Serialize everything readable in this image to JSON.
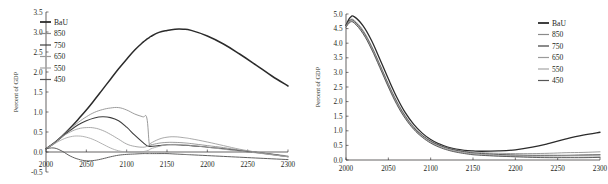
{
  "figure": {
    "background": "#ffffff",
    "panels": [
      "left",
      "right"
    ]
  },
  "chart_data": [
    {
      "panel": "left",
      "type": "line",
      "title": "",
      "xlabel": "",
      "ylabel": "Percent of GDP",
      "xlim": [
        2000,
        2300
      ],
      "ylim": [
        -0.5,
        3.5
      ],
      "xticks": [
        2000,
        2050,
        2100,
        2150,
        2200,
        2250,
        2300
      ],
      "xticklabels": [
        "2000",
        "2050",
        "2100",
        "2150",
        "2200",
        "2250",
        "2300"
      ],
      "yticks": [
        -0.5,
        0.0,
        0.5,
        1.0,
        1.5,
        2.0,
        2.5,
        3.0,
        3.5
      ],
      "yticklabels": [
        "-0.5",
        "0.0",
        "0.5",
        "1.0",
        "1.5",
        "2.0",
        "2.5",
        "3.0",
        "3.5"
      ],
      "grid": false,
      "legend_position": "upper-left",
      "x": [
        2000,
        2010,
        2020,
        2030,
        2040,
        2050,
        2060,
        2070,
        2080,
        2090,
        2100,
        2110,
        2120,
        2125,
        2128,
        2130,
        2140,
        2150,
        2160,
        2170,
        2180,
        2200,
        2220,
        2240,
        2260,
        2280,
        2300
      ],
      "series": [
        {
          "name": "BaU",
          "color": "#2b2b2b",
          "width": 1.5,
          "values": [
            0.08,
            0.22,
            0.4,
            0.6,
            0.82,
            1.05,
            1.3,
            1.56,
            1.82,
            2.08,
            2.32,
            2.55,
            2.74,
            2.82,
            2.86,
            2.89,
            2.99,
            3.04,
            3.07,
            3.07,
            3.04,
            2.9,
            2.7,
            2.45,
            2.18,
            1.9,
            1.65
          ]
        },
        {
          "name": "850",
          "color": "#8a8a8a",
          "width": 0.85,
          "values": [
            0.08,
            0.22,
            0.4,
            0.58,
            0.74,
            0.88,
            0.99,
            1.06,
            1.1,
            1.11,
            1.05,
            0.95,
            0.88,
            0.85,
            0.2,
            0.18,
            0.22,
            0.24,
            0.24,
            0.23,
            0.21,
            0.16,
            0.11,
            0.05,
            0.0,
            -0.05,
            -0.1
          ]
        },
        {
          "name": "750",
          "color": "#3d3d3d",
          "width": 1.1,
          "values": [
            0.08,
            0.22,
            0.38,
            0.54,
            0.68,
            0.78,
            0.85,
            0.88,
            0.86,
            0.78,
            0.62,
            0.42,
            0.24,
            0.16,
            0.14,
            0.14,
            0.16,
            0.18,
            0.18,
            0.17,
            0.16,
            0.12,
            0.08,
            0.03,
            -0.01,
            -0.06,
            -0.12
          ]
        },
        {
          "name": "650",
          "color": "#9a9a9a",
          "width": 0.85,
          "values": [
            0.08,
            0.22,
            0.38,
            0.5,
            0.58,
            0.61,
            0.6,
            0.54,
            0.44,
            0.32,
            0.2,
            0.14,
            0.12,
            0.14,
            0.18,
            0.22,
            0.32,
            0.37,
            0.38,
            0.36,
            0.33,
            0.25,
            0.16,
            0.07,
            0.0,
            -0.06,
            -0.12
          ]
        },
        {
          "name": "550",
          "color": "#a5a5a5",
          "width": 0.85,
          "values": [
            0.08,
            0.2,
            0.31,
            0.38,
            0.4,
            0.37,
            0.3,
            0.2,
            0.1,
            0.03,
            0.0,
            0.0,
            0.01,
            0.03,
            0.05,
            0.08,
            0.14,
            0.18,
            0.19,
            0.18,
            0.16,
            0.12,
            0.07,
            0.02,
            -0.02,
            -0.07,
            -0.12
          ]
        },
        {
          "name": "450",
          "color": "#565656",
          "width": 0.95,
          "values": [
            0.08,
            0.1,
            0.02,
            -0.1,
            -0.18,
            -0.22,
            -0.21,
            -0.17,
            -0.12,
            -0.08,
            -0.06,
            -0.05,
            -0.04,
            -0.04,
            -0.04,
            -0.04,
            -0.04,
            -0.04,
            -0.05,
            -0.06,
            -0.07,
            -0.09,
            -0.11,
            -0.13,
            -0.15,
            -0.17,
            -0.19
          ]
        }
      ]
    },
    {
      "panel": "right",
      "type": "line",
      "title": "",
      "xlabel": "",
      "ylabel": "Percent of GDP",
      "xlim": [
        2000,
        2300
      ],
      "ylim": [
        0.0,
        5.0
      ],
      "xticks": [
        2000,
        2050,
        2100,
        2150,
        2200,
        2250,
        2300
      ],
      "xticklabels": [
        "2000",
        "2050",
        "2100",
        "2150",
        "2200",
        "2250",
        "2300"
      ],
      "yticks": [
        0.0,
        0.5,
        1.0,
        1.5,
        2.0,
        2.5,
        3.0,
        3.5,
        4.0,
        4.5,
        5.0
      ],
      "yticklabels": [
        "0.0",
        "0.5",
        "1.0",
        "1.5",
        "2.0",
        "2.5",
        "3.0",
        "3.5",
        "4.0",
        "4.5",
        "5.0"
      ],
      "grid": false,
      "legend_position": "upper-right",
      "x": [
        2000,
        2005,
        2010,
        2020,
        2030,
        2040,
        2050,
        2060,
        2070,
        2080,
        2090,
        2100,
        2110,
        2120,
        2130,
        2140,
        2150,
        2160,
        2180,
        2200,
        2220,
        2240,
        2260,
        2280,
        2300
      ],
      "series": [
        {
          "name": "BaU",
          "color": "#2b2b2b",
          "width": 1.3,
          "values": [
            4.62,
            4.88,
            4.9,
            4.6,
            4.1,
            3.45,
            2.78,
            2.15,
            1.62,
            1.22,
            0.92,
            0.7,
            0.55,
            0.44,
            0.37,
            0.33,
            0.31,
            0.3,
            0.31,
            0.35,
            0.44,
            0.57,
            0.72,
            0.85,
            0.95
          ]
        },
        {
          "name": "850",
          "color": "#8a8a8a",
          "width": 0.85,
          "values": [
            4.6,
            4.8,
            4.78,
            4.45,
            3.92,
            3.28,
            2.62,
            2.02,
            1.52,
            1.14,
            0.86,
            0.66,
            0.52,
            0.42,
            0.35,
            0.3,
            0.27,
            0.25,
            0.23,
            0.22,
            0.22,
            0.23,
            0.25,
            0.26,
            0.28
          ]
        },
        {
          "name": "750",
          "color": "#3d3d3d",
          "width": 1.0,
          "values": [
            4.6,
            4.78,
            4.74,
            4.4,
            3.88,
            3.24,
            2.58,
            1.98,
            1.49,
            1.11,
            0.84,
            0.64,
            0.5,
            0.4,
            0.33,
            0.28,
            0.24,
            0.22,
            0.19,
            0.17,
            0.16,
            0.16,
            0.16,
            0.17,
            0.18
          ]
        },
        {
          "name": "650",
          "color": "#9a9a9a",
          "width": 0.85,
          "values": [
            4.58,
            4.76,
            4.72,
            4.38,
            3.86,
            3.22,
            2.56,
            1.96,
            1.47,
            1.09,
            0.82,
            0.62,
            0.48,
            0.38,
            0.31,
            0.26,
            0.22,
            0.2,
            0.17,
            0.15,
            0.14,
            0.14,
            0.15,
            0.16,
            0.17
          ]
        },
        {
          "name": "550",
          "color": "#a5a5a5",
          "width": 0.85,
          "values": [
            4.56,
            4.74,
            4.7,
            4.35,
            3.83,
            3.19,
            2.53,
            1.93,
            1.44,
            1.07,
            0.8,
            0.6,
            0.46,
            0.36,
            0.29,
            0.24,
            0.2,
            0.17,
            0.14,
            0.12,
            0.11,
            0.1,
            0.1,
            0.1,
            0.11
          ]
        },
        {
          "name": "450",
          "color": "#565656",
          "width": 0.95,
          "values": [
            4.55,
            4.72,
            4.68,
            4.33,
            3.8,
            3.16,
            2.5,
            1.9,
            1.42,
            1.05,
            0.78,
            0.58,
            0.44,
            0.34,
            0.27,
            0.22,
            0.18,
            0.16,
            0.13,
            0.11,
            0.09,
            0.08,
            0.08,
            0.08,
            0.09
          ]
        }
      ]
    }
  ]
}
